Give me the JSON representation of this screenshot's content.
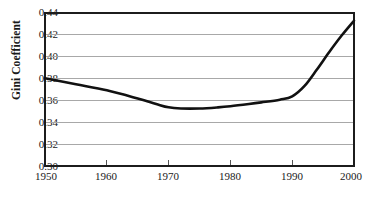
{
  "chart_data": {
    "type": "line",
    "title": "",
    "subtitle": "",
    "xlabel": "",
    "ylabel": "Gini Coefficient",
    "xlim": [
      1950,
      2000
    ],
    "ylim": [
      0.3,
      0.44
    ],
    "grid": "horizontal",
    "legend": "none",
    "x_ticks": [
      1950,
      1960,
      1970,
      1980,
      1990,
      2000
    ],
    "x_tick_labels": [
      "1950",
      "1960",
      "1970",
      "1980",
      "1990",
      "2000"
    ],
    "y_ticks": [
      0.3,
      0.32,
      0.34,
      0.36,
      0.38,
      0.4,
      0.42,
      0.44
    ],
    "y_tick_labels": [
      "0.30",
      "0.32",
      "0.34",
      "0.36",
      "0.38",
      "0.40",
      "0.42",
      "0.44"
    ],
    "series": [
      {
        "name": "Gini Coefficient",
        "color": "#111111",
        "x": [
          1950,
          1955,
          1960,
          1965,
          1968,
          1970,
          1972,
          1975,
          1978,
          1980,
          1983,
          1985,
          1988,
          1990,
          1992,
          1994,
          1996,
          1998,
          2000
        ],
        "values": [
          0.38,
          0.3745,
          0.369,
          0.3615,
          0.3565,
          0.3535,
          0.3525,
          0.3525,
          0.3535,
          0.3545,
          0.3565,
          0.358,
          0.3605,
          0.3635,
          0.373,
          0.388,
          0.404,
          0.419,
          0.4325
        ]
      }
    ],
    "colors": {
      "line": "#111111",
      "gridline": "#a8a8a8",
      "frame": "#1c1c1c",
      "background": "#ffffff",
      "text": "#1a1a1a"
    }
  }
}
